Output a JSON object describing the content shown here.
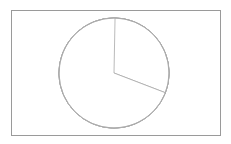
{
  "figure": {
    "title": "",
    "background_color": "#ffffff",
    "width": 231,
    "height": 144
  },
  "frame": {
    "label": "plot-border",
    "x": 11,
    "y": 10,
    "width": 209,
    "height": 125,
    "stroke_color": "#9a9a9a",
    "stroke_width": 1
  },
  "chart_data": {
    "type": "pie",
    "title": "",
    "xlabel": "",
    "ylabel": "",
    "legend": null,
    "grid": false,
    "labels_shown": false,
    "values_shown": false,
    "center": {
      "x": 114,
      "y": 73
    },
    "radius": 55,
    "stroke_color": "#a8a8a8",
    "fill_color": "#ffffff",
    "start_angle_deg": -88.9,
    "direction": "counterclockwise",
    "categories": [
      "slice-1",
      "slice-2",
      "slice-3",
      "slice-4",
      "slice-5",
      "slice-6"
    ],
    "values": [
      20.1,
      47.0,
      61.9,
      46.1,
      125.1,
      59.8
    ],
    "angles_deg": [
      20.1,
      47.0,
      61.9,
      46.1,
      125.1,
      59.8
    ],
    "percentages": [
      5.6,
      13.1,
      17.2,
      12.8,
      34.8,
      16.6
    ],
    "boundary_angles_deg": [
      -88.9,
      -109.0,
      -156.0,
      142.0,
      96.0,
      21.0
    ],
    "boundary_points": [
      {
        "x": 115,
        "y": 19
      },
      {
        "x": 96,
        "y": 21
      },
      {
        "x": 62,
        "y": 51
      },
      {
        "x": 71,
        "y": 107
      },
      {
        "x": 108,
        "y": 128
      },
      {
        "x": 165,
        "y": 93
      }
    ]
  }
}
